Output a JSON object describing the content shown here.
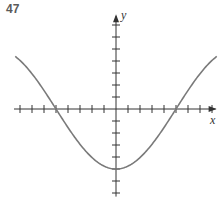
{
  "problem_number": "47",
  "chart_data": {
    "type": "line",
    "title": "",
    "xlabel": "x",
    "ylabel": "y",
    "grid": false,
    "tick_labels": false,
    "x_ticks": [
      -8,
      -7,
      -6,
      -5,
      -4,
      -3,
      -2,
      -1,
      1,
      2,
      3,
      4,
      5,
      6,
      7,
      8
    ],
    "y_ticks": [
      -7,
      -6,
      -5,
      -4,
      -3,
      -2,
      -1,
      1,
      2,
      3,
      4,
      5,
      6,
      7
    ],
    "xlim": [
      -8.5,
      8.3
    ],
    "ylim": [
      -7.3,
      7.9
    ],
    "series": [
      {
        "name": "curve",
        "equation_shape": "y = -5 cos(pi x / 10)",
        "x": [
          -8.4,
          -8,
          -7,
          -6,
          -5,
          -4,
          -3,
          -2,
          -1,
          0,
          1,
          2,
          3,
          4,
          5,
          6,
          7,
          8,
          8.4
        ],
        "y": [
          4.38,
          4.05,
          2.94,
          1.55,
          0,
          -1.55,
          -2.94,
          -4.05,
          -4.76,
          -5,
          -4.76,
          -4.05,
          -2.94,
          -1.55,
          0,
          1.55,
          2.94,
          4.05,
          4.38
        ]
      }
    ],
    "annotations": [
      "x-intercepts at x = -5 and x = 5",
      "minimum at (0, -5)"
    ]
  },
  "colors": {
    "axis": "#333333",
    "curve": "#7a7a7a",
    "label": "#5a5a5a"
  }
}
